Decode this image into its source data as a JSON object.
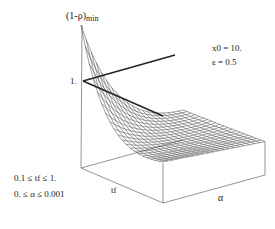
{
  "chart_data": {
    "type": "surface3d",
    "title": "",
    "zlabel": "(1-ρ)",
    "zlabel_sub": "min",
    "xlabel": "tf",
    "ylabel": "α",
    "z_tick_labels": [
      "1."
    ],
    "parameters": [
      "x0 = 10.",
      "ε = 0.5"
    ],
    "ranges": [
      "0.1 ≤ tf ≤ 1.",
      "0. ≤ α ≤ 0.001"
    ],
    "xlim": [
      0.1,
      1.0
    ],
    "ylim": [
      0.0,
      0.001
    ],
    "grid": {
      "rows": 20,
      "cols": 20
    },
    "surface_description": "Mesh surface decreasing from a maximum at tf=0.1, α=0 toward low values at large tf and large α",
    "highlight_lines": [
      {
        "name": "upper-curve",
        "from_z": 1.0
      },
      {
        "name": "lower-curve",
        "from_z": 1.0
      }
    ]
  },
  "labels": {
    "zlabel": "(1-ρ)",
    "zlabel_sub": "min",
    "tick_one": "1.",
    "param_x0": "x0 = 10.",
    "param_eps": "ε = 0.5",
    "range_tf": "0.1 ≤ tf ≤ 1.",
    "range_alpha": "0. ≤ α ≤ 0.001",
    "axis_tf": "tf",
    "axis_alpha": "α"
  },
  "colors": {
    "line": "#333333",
    "mesh": "#444444",
    "box": "#555555"
  }
}
